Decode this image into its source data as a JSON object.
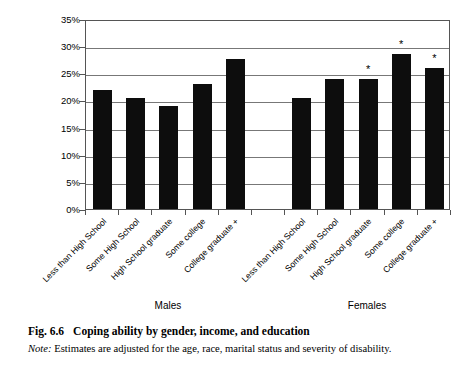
{
  "chart_data": {
    "type": "bar",
    "title": "Coping ability by gender, income, and education",
    "xlabel": "",
    "ylabel": "",
    "ylim": [
      0,
      35
    ],
    "ytick_values": [
      0,
      5,
      10,
      15,
      20,
      25,
      30,
      35
    ],
    "ytick_labels": [
      "0%",
      "5%",
      "10%",
      "15%",
      "20%",
      "25%",
      "30%",
      "35%"
    ],
    "grid": true,
    "legend": "none",
    "categories": [
      "Less than High School",
      "Some High School",
      "High School graduate",
      "Some college",
      "College graduate +"
    ],
    "groups": [
      "Males",
      "Females"
    ],
    "series": [
      {
        "name": "Males",
        "values": [
          22.0,
          20.4,
          19.0,
          23.0,
          27.7
        ],
        "significance": [
          "",
          "",
          "",
          "",
          ""
        ]
      },
      {
        "name": "Females",
        "values": [
          20.4,
          23.9,
          23.9,
          28.5,
          26.0
        ],
        "significance": [
          "",
          "",
          "*",
          "*",
          "*"
        ]
      }
    ],
    "annotation_marker": "*"
  },
  "axis": {
    "ticks": [
      {
        "label": "35%",
        "value": 35
      },
      {
        "label": "30%",
        "value": 30
      },
      {
        "label": "25%",
        "value": 25
      },
      {
        "label": "20%",
        "value": 20
      },
      {
        "label": "15%",
        "value": 15
      },
      {
        "label": "10%",
        "value": 10
      },
      {
        "label": "5%",
        "value": 5
      },
      {
        "label": "0%",
        "value": 0
      }
    ]
  },
  "group_labels": [
    {
      "label": "Males"
    },
    {
      "label": "Females"
    }
  ],
  "category_labels": [
    {
      "label": "Less than High School"
    },
    {
      "label": "Some High School"
    },
    {
      "label": "High School graduate"
    },
    {
      "label": "Some college"
    },
    {
      "label": "College graduate +"
    },
    {
      "label": "Less than High School"
    },
    {
      "label": "Some High School"
    },
    {
      "label": "High School graduate"
    },
    {
      "label": "Some college"
    },
    {
      "label": "College graduate +"
    }
  ],
  "caption": {
    "figure_number": "Fig. 6.6",
    "title": "Coping ability by gender, income, and education",
    "note_label": "Note:",
    "note_text": "Estimates are adjusted for the age, race, marital status and severity of disability."
  }
}
